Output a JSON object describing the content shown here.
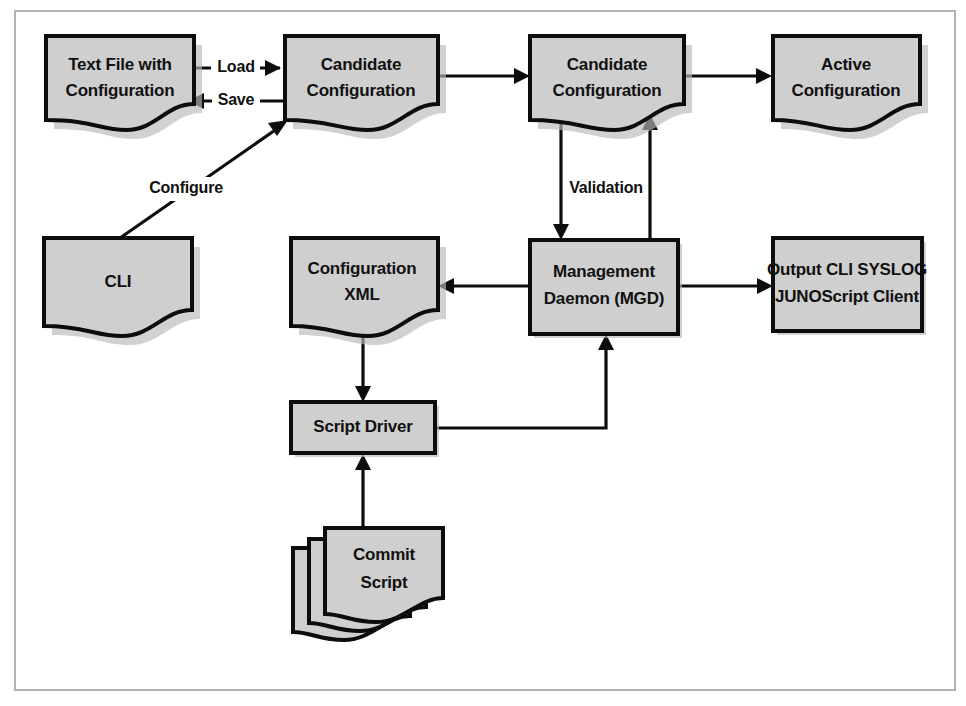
{
  "figure": {
    "frame": {
      "color": "#b2b2b2"
    },
    "palette": {
      "node_fill": "#cfcfcf",
      "node_stroke": "#0d0d0d",
      "text": "#111111",
      "background": "#ffffff"
    }
  },
  "nodes": [
    {
      "id": "text-file",
      "shape": "document",
      "lines": [
        "Text File with",
        "Configuration"
      ],
      "line1": "Text File with",
      "line2": "Configuration"
    },
    {
      "id": "candidate-config-left",
      "shape": "document",
      "lines": [
        "Candidate",
        "Configuration"
      ],
      "line1": "Candidate",
      "line2": "Configuration"
    },
    {
      "id": "candidate-config-right",
      "shape": "document",
      "lines": [
        "Candidate",
        "Configuration"
      ],
      "line1": "Candidate",
      "line2": "Configuration"
    },
    {
      "id": "active-config",
      "shape": "document",
      "lines": [
        "Active",
        "Configuration"
      ],
      "line1": "Active",
      "line2": "Configuration"
    },
    {
      "id": "cli",
      "shape": "document",
      "lines": [
        "CLI"
      ],
      "line1": "CLI"
    },
    {
      "id": "configuration-xml",
      "shape": "document",
      "lines": [
        "Configuration",
        "XML"
      ],
      "line1": "Configuration",
      "line2": "XML"
    },
    {
      "id": "management-daemon",
      "shape": "rectangle",
      "lines": [
        "Management",
        "Daemon (MGD)"
      ],
      "line1": "Management",
      "line2": "Daemon (MGD)"
    },
    {
      "id": "output-clients",
      "shape": "rectangle",
      "lines": [
        "Output CLI SYSLOG",
        "JUNOScript Client"
      ],
      "line1": "Output CLI SYSLOG",
      "line2": "JUNOScript Client"
    },
    {
      "id": "script-driver",
      "shape": "rectangle",
      "lines": [
        "Script Driver"
      ],
      "line1": "Script Driver"
    },
    {
      "id": "commit-script",
      "shape": "stacked-document",
      "lines": [
        "Commit",
        "Script"
      ],
      "line1": "Commit",
      "line2": "Script"
    }
  ],
  "edges": [
    {
      "id": "load",
      "label": "Load",
      "from": "text-file",
      "to": "candidate-config-left",
      "direction": "right"
    },
    {
      "id": "save",
      "label": "Save",
      "from": "candidate-config-left",
      "to": "text-file",
      "direction": "left"
    },
    {
      "id": "configure",
      "label": "Configure",
      "from": "cli",
      "to": "candidate-config-left",
      "direction": "diagonal-up-right"
    },
    {
      "id": "candidate-to-candidate",
      "label": "",
      "from": "candidate-config-left",
      "to": "candidate-config-right",
      "direction": "right"
    },
    {
      "id": "candidate-to-active",
      "label": "",
      "from": "candidate-config-right",
      "to": "active-config",
      "direction": "right"
    },
    {
      "id": "validation-down",
      "label": "Validation",
      "from": "candidate-config-right",
      "to": "management-daemon",
      "direction": "down"
    },
    {
      "id": "validation-up",
      "label": "",
      "from": "management-daemon",
      "to": "candidate-config-right",
      "direction": "up"
    },
    {
      "id": "mgd-to-xml",
      "label": "",
      "from": "management-daemon",
      "to": "configuration-xml",
      "direction": "left"
    },
    {
      "id": "mgd-to-output",
      "label": "",
      "from": "management-daemon",
      "to": "output-clients",
      "direction": "right"
    },
    {
      "id": "xml-to-driver",
      "label": "",
      "from": "configuration-xml",
      "to": "script-driver",
      "direction": "down"
    },
    {
      "id": "driver-to-mgd",
      "label": "",
      "from": "script-driver",
      "to": "management-daemon",
      "direction": "elbow-up-right"
    },
    {
      "id": "commit-to-driver",
      "label": "",
      "from": "commit-script",
      "to": "script-driver",
      "direction": "up"
    }
  ],
  "labels": {
    "load": "Load",
    "save": "Save",
    "configure": "Configure",
    "validation": "Validation"
  }
}
